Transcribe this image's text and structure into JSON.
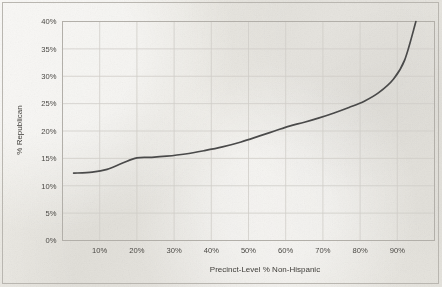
{
  "chart_data": {
    "type": "line",
    "title": "",
    "xlabel": "Precinct-Level % Non-Hispanic",
    "ylabel": "% Republican",
    "xlim": [
      0,
      100
    ],
    "ylim": [
      0,
      40
    ],
    "grid": true,
    "legend": "none",
    "x_ticks": [
      "10%",
      "20%",
      "30%",
      "40%",
      "50%",
      "60%",
      "70%",
      "80%",
      "90%"
    ],
    "x_tick_values": [
      10,
      20,
      30,
      40,
      50,
      60,
      70,
      80,
      90
    ],
    "y_ticks": [
      "0%",
      "5%",
      "10%",
      "15%",
      "20%",
      "25%",
      "30%",
      "35%",
      "40%"
    ],
    "y_tick_values": [
      0,
      5,
      10,
      15,
      20,
      25,
      30,
      35,
      40
    ],
    "series": [
      {
        "name": "% Republican",
        "color": "#4a4a4a",
        "x": [
          3,
          8,
          12,
          16,
          20,
          24,
          28,
          33,
          38,
          43,
          48,
          53,
          57,
          61,
          65,
          69,
          73,
          77,
          81,
          85,
          89,
          92,
          95
        ],
        "values": [
          12.3,
          12.5,
          13.0,
          14.1,
          15.1,
          15.2,
          15.4,
          15.8,
          16.4,
          17.1,
          18.0,
          19.1,
          20.0,
          20.9,
          21.6,
          22.4,
          23.3,
          24.3,
          25.4,
          27.0,
          29.5,
          33.0,
          40.0
        ]
      }
    ]
  },
  "axes": {
    "x_title": "Precinct-Level % Non-Hispanic",
    "y_title": "% Republican"
  },
  "style": {
    "line_color": "#4a4a4a",
    "grid_color": "#cfcdc8",
    "plot_border_color": "#b2afa9",
    "frame_color": "#b9b6b0",
    "background": "#eceae5",
    "text_color": "#4a4844"
  }
}
